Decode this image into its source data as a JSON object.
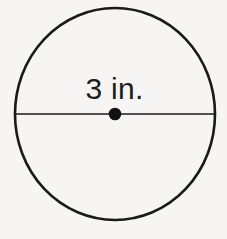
{
  "figure": {
    "type": "circle-with-diameter",
    "background_color": "#f6f5f3",
    "stroke_color": "#1a1a1a",
    "label": "3 in.",
    "label_meaning": "diameter measure",
    "circle": {
      "center_x": 115,
      "center_y": 114,
      "radius_x": 100,
      "radius_y": 106,
      "stroke_width": 2.6
    },
    "diameter_line": {
      "x1": 15,
      "y1": 114,
      "x2": 214,
      "y2": 114,
      "stroke_width": 1.4
    },
    "center_dot": {
      "cx": 115,
      "cy": 114,
      "r": 6.3,
      "fill": "#111111"
    }
  }
}
